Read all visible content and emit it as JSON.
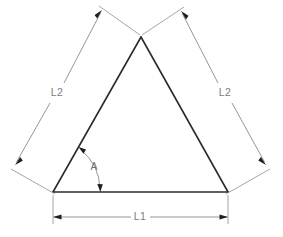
{
  "diagram": {
    "type": "engineering-dimension-drawing",
    "background_color": "#ffffff",
    "shape_color": "#2b2b2b",
    "dimension_color": "#8a8a8a",
    "label_color": "#7d7d7d",
    "labels": {
      "base_length": "L1",
      "left_side_length": "L2",
      "right_side_length": "L2",
      "base_angle": "A"
    },
    "geometry": {
      "apex": {
        "x": 141,
        "y": 37
      },
      "bottom_left": {
        "x": 53,
        "y": 192
      },
      "bottom_right": {
        "x": 228,
        "y": 192
      },
      "base_dimension_y": 217,
      "left_dim_start": {
        "x": 15,
        "y": 165
      },
      "left_dim_end": {
        "x": 102,
        "y": 10
      },
      "right_dim_start": {
        "x": 181,
        "y": 11
      },
      "right_dim_end": {
        "x": 266,
        "y": 165
      }
    },
    "label_positions": {
      "base_length": {
        "x": 140,
        "y": 217
      },
      "left_side_length": {
        "x": 57,
        "y": 93
      },
      "right_side_length": {
        "x": 225,
        "y": 93
      },
      "base_angle": {
        "x": 94,
        "y": 167
      }
    }
  }
}
